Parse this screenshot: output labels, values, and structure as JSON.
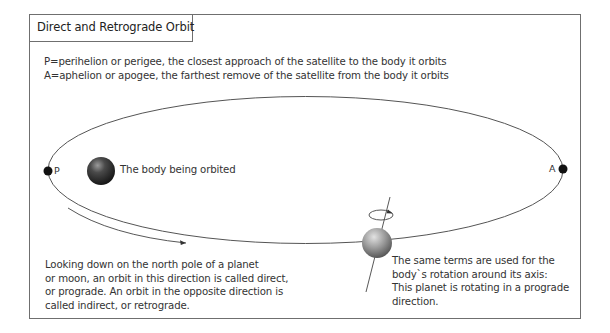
{
  "title": "Direct and Retrograde Orbit",
  "definitions": [
    "P=perihelion or perigee, the closest approach of the satellite to the body it orbits",
    "A=aphelion or apogee, the farthest remove of the satellite from the body it orbits"
  ],
  "labels": {
    "perihelion": "P",
    "aphelion": "A",
    "central_body": "The body being orbited"
  },
  "notes": {
    "orbit_direction": [
      "Looking down on the north pole of a planet",
      "or moon, an orbit in this direction is called direct,",
      "or prograde. An orbit in the opposite direction is",
      "called indirect, or retrograde."
    ],
    "rotation_direction": [
      "The same terms are used for the",
      "body`s rotation around its axis:",
      "This planet is rotating in a prograde",
      "direction."
    ]
  },
  "colors": {
    "frame": "#6f6f6f",
    "orbit_line": "#555555",
    "text": "#333333",
    "central_body_dark": "#1c1c1c",
    "planet_gray": "#8a8a8a"
  }
}
